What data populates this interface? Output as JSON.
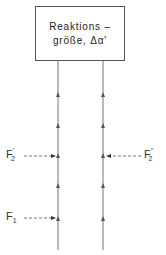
{
  "box": {
    "line1": "Reaktions –",
    "line2": "größe, Δα'"
  },
  "labels": {
    "f2_prime": {
      "base": "F",
      "sub": "2",
      "sup": "'"
    },
    "f2_double_prime": {
      "base": "F",
      "sub": "2",
      "sup": "''"
    },
    "f1": {
      "base": "F",
      "sub": "1"
    }
  },
  "colors": {
    "line": "#777777",
    "text": "#333333",
    "background": "#ffffff"
  }
}
